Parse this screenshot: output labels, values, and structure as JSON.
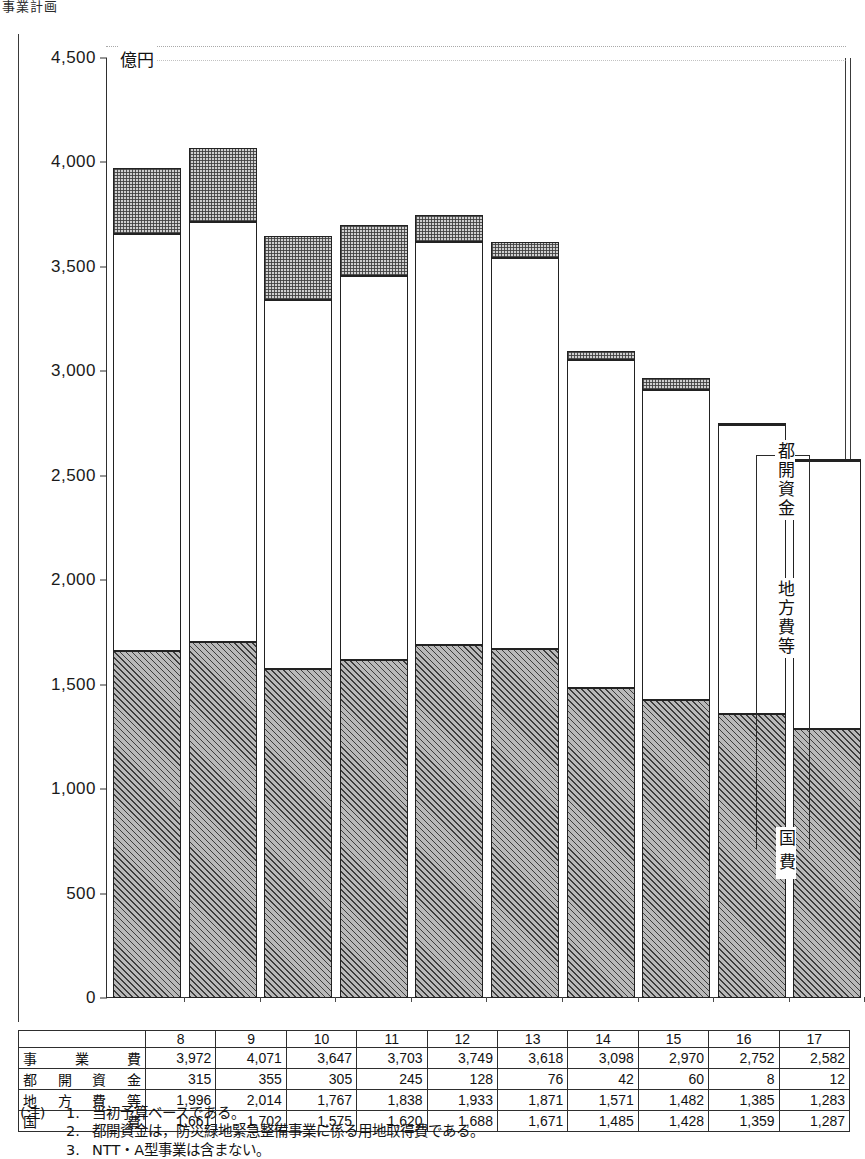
{
  "top_caption": "事業計画",
  "chart_data": {
    "type": "bar",
    "subtype": "stacked",
    "title": "",
    "unit_label": "億円",
    "xlabel": "",
    "ylabel": "",
    "ylim": [
      0,
      4500
    ],
    "ytick_values": [
      0,
      500,
      1000,
      1500,
      2000,
      2500,
      3000,
      3500,
      4000,
      4500
    ],
    "ytick_labels": [
      "0",
      "500",
      "1,000",
      "1,500",
      "2,000",
      "2,500",
      "3,000",
      "3,500",
      "4,000",
      "4,500"
    ],
    "grid": false,
    "legend_position": "right-inside",
    "categories": [
      "8",
      "9",
      "10",
      "11",
      "12",
      "13",
      "14",
      "15",
      "16",
      "17"
    ],
    "series": [
      {
        "name": "国費",
        "key": "kokuhi",
        "pattern": "diagonal-hatch",
        "values": [
          1661,
          1702,
          1575,
          1620,
          1688,
          1671,
          1485,
          1428,
          1359,
          1287
        ]
      },
      {
        "name": "地方費等",
        "key": "chihou",
        "pattern": "white",
        "values": [
          1996,
          2014,
          1767,
          1838,
          1933,
          1871,
          1571,
          1482,
          1385,
          1283
        ]
      },
      {
        "name": "都開資金",
        "key": "tokai",
        "pattern": "fine-checker",
        "values": [
          315,
          355,
          305,
          245,
          128,
          76,
          42,
          60,
          8,
          12
        ]
      }
    ],
    "totals": {
      "name": "事業費",
      "values": [
        3972,
        4071,
        3647,
        3703,
        3749,
        3618,
        3098,
        2970,
        2752,
        2582
      ]
    },
    "legend_labels": [
      "都開資金",
      "地方費等",
      "国費"
    ]
  },
  "table": {
    "corner_label": "",
    "columns": [
      "8",
      "9",
      "10",
      "11",
      "12",
      "13",
      "14",
      "15",
      "16",
      "17"
    ],
    "rows": [
      {
        "label": "事業費",
        "values": [
          "3,972",
          "4,071",
          "3,647",
          "3,703",
          "3,749",
          "3,618",
          "3,098",
          "2,970",
          "2,752",
          "2,582"
        ]
      },
      {
        "label": "都開資金",
        "values": [
          "315",
          "355",
          "305",
          "245",
          "128",
          "76",
          "42",
          "60",
          "8",
          "12"
        ]
      },
      {
        "label": "地方費等",
        "values": [
          "1,996",
          "2,014",
          "1,767",
          "1,838",
          "1,933",
          "1,871",
          "1,571",
          "1,482",
          "1,385",
          "1,283"
        ]
      },
      {
        "label": "国費",
        "values": [
          "1,661",
          "1,702",
          "1,575",
          "1,620",
          "1,688",
          "1,671",
          "1,485",
          "1,428",
          "1,359",
          "1,287"
        ]
      }
    ]
  },
  "notes": {
    "tag": "(注)",
    "items": [
      {
        "index": "1.",
        "text": "当初予算ベースである。"
      },
      {
        "index": "2.",
        "text": "都開資金は，防災緑地緊急整備事業に係る用地取得費である。"
      },
      {
        "index": "3.",
        "text": "NTT・A型事業は含まない。"
      }
    ]
  }
}
